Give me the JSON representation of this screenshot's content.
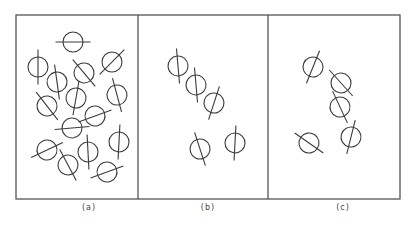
{
  "figure": {
    "stroke_color": "#3a3a3a",
    "frame_color": "#555555",
    "frame": {
      "x1": 16,
      "y1": 15,
      "x2": 400,
      "y2": 199
    },
    "dividers": [
      138,
      268
    ],
    "molecule_radius": 10,
    "panels": [
      {
        "id": "a",
        "label": "(a)",
        "label_x": 89,
        "label_y": 205,
        "description": "Isotropic liquid: random positions and random orientations",
        "molecules": [
          {
            "cx": 73,
            "cy": 42,
            "angle": 90
          },
          {
            "cx": 38,
            "cy": 67,
            "angle": 0
          },
          {
            "cx": 57,
            "cy": 82,
            "angle": -8
          },
          {
            "cx": 84,
            "cy": 73,
            "angle": -40
          },
          {
            "cx": 112,
            "cy": 62,
            "angle": 45
          },
          {
            "cx": 47,
            "cy": 106,
            "angle": -38
          },
          {
            "cx": 76,
            "cy": 98,
            "angle": 10
          },
          {
            "cx": 117,
            "cy": 95,
            "angle": -15
          },
          {
            "cx": 95,
            "cy": 116,
            "angle": 70
          },
          {
            "cx": 72,
            "cy": 128,
            "angle": 85
          },
          {
            "cx": 47,
            "cy": 150,
            "angle": 65
          },
          {
            "cx": 68,
            "cy": 165,
            "angle": -28
          },
          {
            "cx": 88,
            "cy": 152,
            "angle": -3
          },
          {
            "cx": 119,
            "cy": 142,
            "angle": 3
          },
          {
            "cx": 107,
            "cy": 172,
            "angle": 70
          }
        ]
      },
      {
        "id": "b",
        "label": "(b)",
        "label_x": 208,
        "label_y": 205,
        "description": "Nematic: random positions, parallel orientation",
        "molecules": [
          {
            "cx": 178,
            "cy": 66,
            "angle": -5
          },
          {
            "cx": 196,
            "cy": 85,
            "angle": -5
          },
          {
            "cx": 214,
            "cy": 103,
            "angle": 18
          },
          {
            "cx": 200,
            "cy": 149,
            "angle": -18
          },
          {
            "cx": 235,
            "cy": 143,
            "angle": 3
          }
        ]
      },
      {
        "id": "c",
        "label": "(c)",
        "label_x": 343,
        "label_y": 205,
        "description": "Partially ordered: molecules tilted with intermediate order",
        "molecules": [
          {
            "cx": 313,
            "cy": 67,
            "angle": 22
          },
          {
            "cx": 341,
            "cy": 83,
            "angle": -42
          },
          {
            "cx": 340,
            "cy": 107,
            "angle": -25
          },
          {
            "cx": 309,
            "cy": 143,
            "angle": -55
          },
          {
            "cx": 351,
            "cy": 137,
            "angle": 14
          }
        ]
      }
    ]
  }
}
